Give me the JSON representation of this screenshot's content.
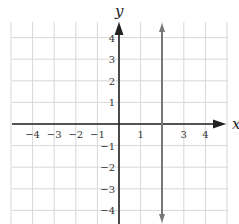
{
  "chart_data": {
    "type": "line",
    "title": "",
    "xlabel": "x",
    "ylabel": "y",
    "xlim": [
      -5,
      5
    ],
    "ylim": [
      -5,
      5
    ],
    "grid": true,
    "x_ticks": [
      "-4",
      "-3",
      "-2",
      "-1",
      "1",
      "3",
      "4"
    ],
    "y_ticks": [
      "4",
      "3",
      "2",
      "1",
      "-1",
      "-2",
      "-3",
      "-4"
    ],
    "series": [
      {
        "name": "x = 2",
        "type": "vertical-line",
        "x": 2,
        "color": "#777777",
        "arrows": "both"
      }
    ]
  },
  "labels": {
    "x_axis": "x",
    "y_axis": "y",
    "x_ticks": [
      {
        "v": -4,
        "t": "−4"
      },
      {
        "v": -3,
        "t": "−3"
      },
      {
        "v": -2,
        "t": "−2"
      },
      {
        "v": -1,
        "t": "−1"
      },
      {
        "v": 1,
        "t": "1"
      },
      {
        "v": 3,
        "t": "3"
      },
      {
        "v": 4,
        "t": "4"
      }
    ],
    "y_ticks": [
      {
        "v": 4,
        "t": "4"
      },
      {
        "v": 3,
        "t": "3"
      },
      {
        "v": 2,
        "t": "2"
      },
      {
        "v": 1,
        "t": "1"
      },
      {
        "v": -1,
        "t": "−1"
      },
      {
        "v": -2,
        "t": "−2"
      },
      {
        "v": -3,
        "t": "−3"
      },
      {
        "v": -4,
        "t": "−4"
      }
    ]
  }
}
